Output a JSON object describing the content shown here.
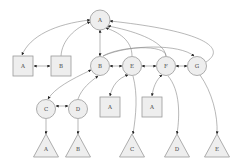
{
  "diagram": {
    "type": "directed-graph",
    "colors": {
      "node_fill": "#eeeeee",
      "node_stroke": "#999999",
      "edge": "#888888",
      "arrow": "#222222",
      "label": "#444444"
    },
    "nodes": [
      {
        "id": "root_A",
        "shape": "circle",
        "label": "A",
        "cx": 100,
        "cy": 20,
        "r": 10
      },
      {
        "id": "sq_A",
        "shape": "square",
        "label": "A",
        "cx": 23,
        "cy": 66,
        "size": 20
      },
      {
        "id": "sq_B",
        "shape": "square",
        "label": "B",
        "cx": 61,
        "cy": 66,
        "size": 20
      },
      {
        "id": "c_B",
        "shape": "circle",
        "label": "B",
        "cx": 100,
        "cy": 66,
        "r": 9.5
      },
      {
        "id": "c_E",
        "shape": "circle",
        "label": "E",
        "cx": 132,
        "cy": 66,
        "r": 9.5
      },
      {
        "id": "c_F",
        "shape": "circle",
        "label": "F",
        "cx": 166,
        "cy": 66,
        "r": 9.5
      },
      {
        "id": "c_G",
        "shape": "circle",
        "label": "G",
        "cx": 197,
        "cy": 66,
        "r": 9.5
      },
      {
        "id": "c_C",
        "shape": "circle",
        "label": "C",
        "cx": 46,
        "cy": 109,
        "r": 9.5
      },
      {
        "id": "c_D",
        "shape": "circle",
        "label": "D",
        "cx": 78,
        "cy": 109,
        "r": 9.5
      },
      {
        "id": "sq_A2",
        "shape": "square",
        "label": "A",
        "cx": 110,
        "cy": 107,
        "size": 20
      },
      {
        "id": "sq_A3",
        "shape": "square",
        "label": "A",
        "cx": 152,
        "cy": 107,
        "size": 20
      },
      {
        "id": "t_A",
        "shape": "triangle",
        "label": "A",
        "cx": 46,
        "top": 134,
        "bottom": 157,
        "half": 12.5
      },
      {
        "id": "t_B",
        "shape": "triangle",
        "label": "B",
        "cx": 78,
        "top": 134,
        "bottom": 157,
        "half": 12.5
      },
      {
        "id": "t_C",
        "shape": "triangle",
        "label": "C",
        "cx": 132,
        "top": 134,
        "bottom": 157,
        "half": 12.5
      },
      {
        "id": "t_D",
        "shape": "triangle",
        "label": "D",
        "cx": 177,
        "top": 134,
        "bottom": 157,
        "half": 12.5
      },
      {
        "id": "t_E",
        "shape": "triangle",
        "label": "E",
        "cx": 217,
        "top": 134,
        "bottom": 157,
        "half": 12.5
      }
    ],
    "edges": [
      {
        "from": "root_A",
        "to": "sq_A",
        "path": "M90,20 C55,24 30,36 22,55",
        "arrow_end": true,
        "arrow_start": true
      },
      {
        "from": "sq_B",
        "to": "root_A",
        "path": "M61,56 C62,40 75,28 90,22",
        "arrow_end": true
      },
      {
        "from": "sq_A",
        "to": "sq_B",
        "path": "M34,66 L50,66",
        "arrow_end": true,
        "arrow_start": true
      },
      {
        "from": "root_A",
        "to": "c_B",
        "path": "M100,30 L100,56",
        "arrow_end": true,
        "arrow_start": true
      },
      {
        "from": "c_E",
        "to": "root_A",
        "path": "M132,56 C132,40 118,32 106,28",
        "arrow_end": true
      },
      {
        "from": "c_F",
        "to": "root_A",
        "path": "M166,56 C164,40 130,30 108,26",
        "arrow_end": true
      },
      {
        "from": "c_G",
        "to": "root_A",
        "path": "M206,62 C225,50 212,32 110,21",
        "arrow_end": true
      },
      {
        "from": "c_F",
        "to": "c_B",
        "path": "M166,56 C166,44 120,46 103,56",
        "arrow_end": false
      },
      {
        "from": "c_B",
        "to": "c_G",
        "path": "M103,56 C130,44 180,44 194,56",
        "arrow_end": true
      },
      {
        "from": "c_E",
        "to": "c_B",
        "path": "M122,66 L110,66",
        "arrow_end": true,
        "arrow_start": true
      },
      {
        "from": "c_F",
        "to": "c_E",
        "path": "M156,66 L142,66",
        "arrow_end": true,
        "arrow_start": true
      },
      {
        "from": "c_G",
        "to": "c_F",
        "path": "M187,66 L176,66",
        "arrow_end": true,
        "arrow_start": true
      },
      {
        "from": "c_B",
        "to": "c_C",
        "path": "M91,70 C70,80 55,88 48,99",
        "arrow_end": true,
        "arrow_start": true
      },
      {
        "from": "c_D",
        "to": "c_B",
        "path": "M78,99 C82,88 90,82 98,76",
        "arrow_end": true
      },
      {
        "from": "c_C",
        "to": "c_D",
        "path": "M56,106 L68,106",
        "arrow_end": true,
        "arrow_start": true
      },
      {
        "from": "c_E",
        "to": "sq_A2",
        "path": "M128,75 C118,78 112,86 110,96",
        "arrow_end": true,
        "arrow_start": true
      },
      {
        "from": "c_E",
        "to": "t_C",
        "path": "M133,76 C138,95 136,115 133,134",
        "arrow_end": true
      },
      {
        "from": "c_F",
        "to": "sq_A3",
        "path": "M162,75 C156,80 153,88 152,96",
        "arrow_end": true,
        "arrow_start": true
      },
      {
        "from": "c_F",
        "to": "t_D",
        "path": "M168,76 C180,90 180,115 177,134",
        "arrow_end": true
      },
      {
        "from": "c_G",
        "to": "t_E",
        "path": "M200,75 C212,92 218,115 217,134",
        "arrow_end": true
      },
      {
        "from": "c_C",
        "to": "t_A",
        "path": "M46,119 L46,134",
        "arrow_end": true
      },
      {
        "from": "c_D",
        "to": "t_B",
        "path": "M78,119 L78,134",
        "arrow_end": true
      }
    ]
  }
}
